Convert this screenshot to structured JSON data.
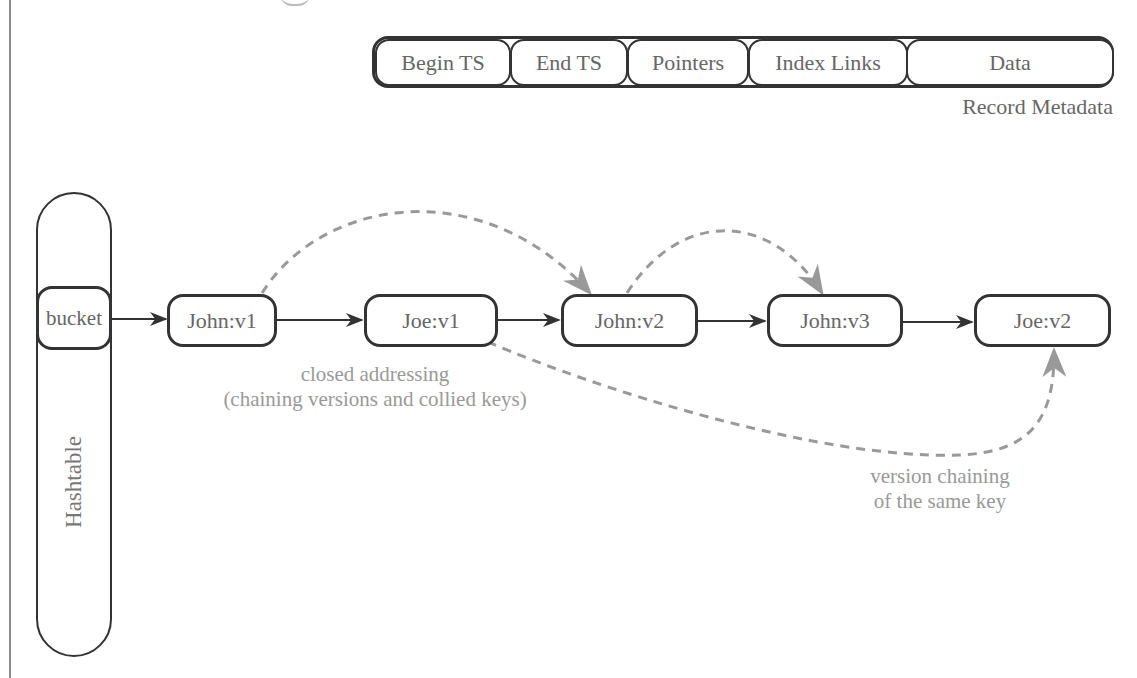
{
  "record_metadata": {
    "fields": [
      {
        "label": "Begin TS"
      },
      {
        "label": "End TS"
      },
      {
        "label": "Pointers"
      },
      {
        "label": "Index Links"
      },
      {
        "label": "Data"
      }
    ],
    "caption": "Record Metadata"
  },
  "hashtable": {
    "label": "Hashtable",
    "bucket_label": "bucket"
  },
  "chain": {
    "nodes": [
      {
        "label": "John:v1"
      },
      {
        "label": "Joe:v1"
      },
      {
        "label": "John:v2"
      },
      {
        "label": "John:v3"
      },
      {
        "label": "Joe:v2"
      }
    ]
  },
  "annotations": {
    "closed_addressing": {
      "line1": "closed addressing",
      "line2": "(chaining versions and collied keys)"
    },
    "version_chaining": {
      "line1": "version chaining",
      "line2": "of the same key"
    }
  },
  "colors": {
    "node_border": "#333333",
    "solid_arrow": "#333333",
    "dashed_arrow": "#999999",
    "annotation_text": "#999999",
    "label_text": "#666666"
  }
}
